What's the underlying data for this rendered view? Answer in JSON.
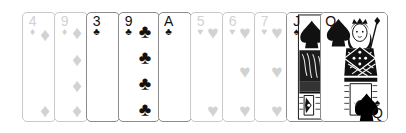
{
  "scene": {
    "title": "Playing card hand",
    "background_color": "#ffffff",
    "card_face_color": "#ffffff",
    "ink_color": "#111111",
    "faded_color": "#d2d2d2",
    "border_color": "#8c8c8c",
    "faded_border_color": "#c9c9c9"
  },
  "hand": {
    "card_count": 10,
    "cards": [
      {
        "id": "card-1",
        "rank": "4",
        "suit": "diamonds",
        "suit_glyph": "♦",
        "label": "4 of Diamonds",
        "state": "faded",
        "left": 22,
        "width": 34,
        "z": 1,
        "visible_pips": 2,
        "pip_positions": [
          8,
          84
        ]
      },
      {
        "id": "card-2",
        "rank": "9",
        "suit": "diamonds",
        "suit_glyph": "♦",
        "label": "9 of Diamonds",
        "state": "faded",
        "left": 54,
        "width": 34,
        "z": 2,
        "visible_pips": 4,
        "pip_positions": [
          6,
          33,
          59,
          84
        ]
      },
      {
        "id": "card-3",
        "rank": "3",
        "suit": "clubs",
        "suit_glyph": "♣",
        "label": "3 of Clubs",
        "state": "solid",
        "left": 86,
        "width": 34,
        "z": 3,
        "visible_pips": 0,
        "pip_positions": []
      },
      {
        "id": "card-4",
        "rank": "9",
        "suit": "clubs",
        "suit_glyph": "♣",
        "label": "9 of Clubs",
        "state": "solid",
        "left": 118,
        "width": 42,
        "z": 4,
        "visible_pips": 4,
        "pip_positions": [
          5,
          31,
          57,
          83
        ]
      },
      {
        "id": "card-5",
        "rank": "A",
        "suit": "clubs",
        "suit_glyph": "♣",
        "label": "Ace of Clubs",
        "state": "solid",
        "left": 158,
        "width": 34,
        "z": 5,
        "visible_pips": 0,
        "pip_positions": []
      },
      {
        "id": "card-6",
        "rank": "5",
        "suit": "hearts",
        "suit_glyph": "♥",
        "label": "5 of Hearts",
        "state": "faded",
        "left": 190,
        "width": 34,
        "z": 6,
        "visible_pips": 2,
        "pip_positions": [
          6,
          84
        ]
      },
      {
        "id": "card-7",
        "rank": "6",
        "suit": "hearts",
        "suit_glyph": "♥",
        "label": "6 of Hearts",
        "state": "faded",
        "left": 222,
        "width": 34,
        "z": 7,
        "visible_pips": 3,
        "pip_positions": [
          6,
          45,
          84
        ]
      },
      {
        "id": "card-8",
        "rank": "7",
        "suit": "hearts",
        "suit_glyph": "♥",
        "label": "7 of Hearts",
        "state": "faded",
        "left": 254,
        "width": 34,
        "z": 8,
        "visible_pips": 3,
        "pip_positions": [
          6,
          45,
          84
        ]
      },
      {
        "id": "card-9",
        "rank": "J",
        "suit": "spades",
        "suit_glyph": "♠",
        "label": "Jack of Spades",
        "state": "solid",
        "court": true,
        "left": 286,
        "width": 40,
        "z": 9,
        "visible_pips": 0,
        "pip_positions": []
      },
      {
        "id": "card-10",
        "rank": "Q",
        "suit": "spades",
        "suit_glyph": "♠",
        "label": "Queen of Spades",
        "state": "solid",
        "court": true,
        "left": 320,
        "width": 68,
        "z": 10,
        "visible_pips": 0,
        "pip_positions": []
      }
    ]
  }
}
